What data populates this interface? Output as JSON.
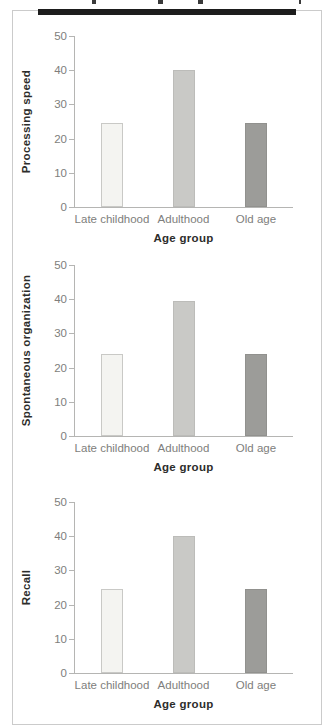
{
  "figure": {
    "top_rule_color": "#1d1d1d",
    "border_color": "#cbcbcb",
    "axis_color": "#b5b5b3",
    "tick_text_color": "#7e7e7c",
    "label_text_color": "#2d2d2b"
  },
  "chart_data": [
    {
      "type": "bar",
      "ylabel": "Processing speed",
      "xlabel": "Age group",
      "categories": [
        "Late childhood",
        "Adulthood",
        "Old age"
      ],
      "values": [
        24.5,
        40,
        24.5
      ],
      "yticks": [
        0,
        10,
        20,
        30,
        40,
        50
      ],
      "ylim": [
        0,
        50
      ],
      "grid": false,
      "legend": "none",
      "bar_fills": [
        "#f4f4f1",
        "#c9c9c6",
        "#9c9c99"
      ],
      "bar_borders": [
        "#c9c9c6",
        "#bcbcb9",
        "#91918e"
      ]
    },
    {
      "type": "bar",
      "ylabel": "Spontaneous organization",
      "xlabel": "Age group",
      "categories": [
        "Late childhood",
        "Adulthood",
        "Old age"
      ],
      "values": [
        24,
        39.5,
        24
      ],
      "yticks": [
        0,
        10,
        20,
        30,
        40,
        50
      ],
      "ylim": [
        0,
        50
      ],
      "grid": false,
      "legend": "none",
      "bar_fills": [
        "#f4f4f1",
        "#c9c9c6",
        "#9c9c99"
      ],
      "bar_borders": [
        "#c9c9c6",
        "#bcbcb9",
        "#91918e"
      ]
    },
    {
      "type": "bar",
      "ylabel": "Recall",
      "xlabel": "Age group",
      "categories": [
        "Late childhood",
        "Adulthood",
        "Old age"
      ],
      "values": [
        24.5,
        40,
        24.5
      ],
      "yticks": [
        0,
        10,
        20,
        30,
        40,
        50
      ],
      "ylim": [
        0,
        50
      ],
      "grid": false,
      "legend": "none",
      "bar_fills": [
        "#f4f4f1",
        "#c9c9c6",
        "#9c9c99"
      ],
      "bar_borders": [
        "#c9c9c6",
        "#bcbcb9",
        "#91918e"
      ]
    }
  ]
}
